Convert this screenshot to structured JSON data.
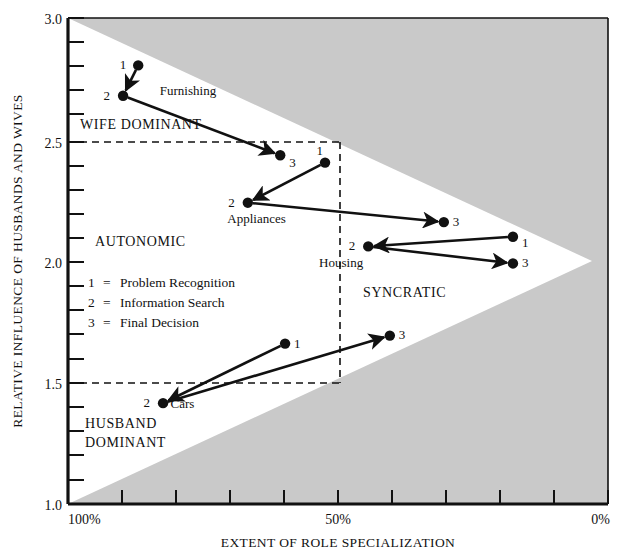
{
  "chart_data": {
    "type": "scatter",
    "title": "",
    "xlabel": "EXTENT OF ROLE SPECIALIZATION",
    "ylabel": "RELATIVE INFLUENCE OF HUSBANDS AND WIVES",
    "xlim": [
      100,
      0
    ],
    "ylim": [
      1.0,
      3.0
    ],
    "x_unit": "%",
    "x_tick_labels": [
      "100%",
      "50%",
      "0%"
    ],
    "x_major_ticks": [
      100,
      50,
      0
    ],
    "x_minor_tick_step": 10,
    "y_tick_labels": [
      "1.0",
      "1.5",
      "2.0",
      "2.5",
      "3.0"
    ],
    "y_major_ticks": [
      1.0,
      1.5,
      2.0,
      2.5,
      3.0
    ],
    "y_minor_tick_step": 0.1,
    "grid": false,
    "legend_position": "inside-left",
    "point_legend": [
      "1  =  Problem Recognition",
      "2  =  Information Search",
      "3  =  Final Decision"
    ],
    "legend_entries": [
      {
        "key": "1",
        "equals": "=",
        "label": "Problem Recognition"
      },
      {
        "key": "2",
        "equals": "=",
        "label": "Information Search"
      },
      {
        "key": "3",
        "equals": "=",
        "label": "Final Decision"
      }
    ],
    "region_labels": [
      {
        "name": "wife-dominant",
        "text": "WIFE DOMINANT",
        "x": 93.0,
        "y": 2.58
      },
      {
        "name": "autonomic",
        "text": "AUTONOMIC",
        "x": 93.5,
        "y": 2.05
      },
      {
        "name": "syncratic",
        "text": "SYNCRATIC",
        "x": 50.5,
        "y": 1.81
      },
      {
        "name": "husband-dominant-line1",
        "text": "HUSBAND",
        "x": 93.5,
        "y": 1.38
      },
      {
        "name": "husband-dominant-line2",
        "text": "DOMINANT",
        "x": 93.5,
        "y": 1.3
      }
    ],
    "reference_box": {
      "x_from": 100,
      "x_to": 50,
      "y_from": 1.5,
      "y_to": 2.5,
      "style": "dashed"
    },
    "shaded_regions": [
      {
        "name": "upper-shaded-wedge",
        "color": "#c9c9c9"
      },
      {
        "name": "lower-shaded-wedge",
        "color": "#c9c9c9"
      }
    ],
    "series": [
      {
        "name": "Furnishing",
        "label": "Furnishing",
        "label_x": 83.0,
        "label_y": 2.685,
        "points": [
          {
            "stage": "1",
            "x": 87.0,
            "y": 2.805,
            "num_dx": -12,
            "num_dy": 4
          },
          {
            "stage": "2",
            "x": 89.8,
            "y": 2.68,
            "num_dx": -13,
            "num_dy": 4
          },
          {
            "stage": "3",
            "x": 60.7,
            "y": 2.435,
            "num_dx": 9,
            "num_dy": 12
          }
        ],
        "arrows": [
          {
            "from": "1",
            "to": "2"
          },
          {
            "from": "2",
            "to": "3"
          }
        ]
      },
      {
        "name": "Appliances",
        "label": "Appliances",
        "label_x": 70.5,
        "label_y": 2.155,
        "points": [
          {
            "stage": "1",
            "x": 52.4,
            "y": 2.405,
            "num_dx": -2,
            "num_dy": -8
          },
          {
            "stage": "2",
            "x": 66.7,
            "y": 2.24,
            "num_dx": -13,
            "num_dy": 4
          },
          {
            "stage": "3",
            "x": 30.4,
            "y": 2.16,
            "num_dx": 9,
            "num_dy": 4
          }
        ],
        "arrows": [
          {
            "from": "1",
            "to": "2"
          },
          {
            "from": "2",
            "to": "3"
          }
        ]
      },
      {
        "name": "Housing",
        "label": "Housing",
        "label_x": 53.5,
        "label_y": 1.975,
        "points": [
          {
            "stage": "1",
            "x": 17.6,
            "y": 2.1,
            "num_dx": 9,
            "num_dy": 10
          },
          {
            "stage": "2",
            "x": 44.4,
            "y": 2.06,
            "num_dx": -13,
            "num_dy": 4
          },
          {
            "stage": "3",
            "x": 17.6,
            "y": 1.99,
            "num_dx": 9,
            "num_dy": 4
          }
        ],
        "arrows": [
          {
            "from": "1",
            "to": "2"
          },
          {
            "from": "2",
            "to": "3"
          }
        ]
      },
      {
        "name": "Cars",
        "label": "Cars",
        "label_x": 81.0,
        "label_y": 1.395,
        "points": [
          {
            "stage": "1",
            "x": 59.8,
            "y": 1.66,
            "num_dx": 9,
            "num_dy": 4
          },
          {
            "stage": "2",
            "x": 82.4,
            "y": 1.415,
            "num_dx": -13,
            "num_dy": 4
          },
          {
            "stage": "3",
            "x": 40.4,
            "y": 1.693,
            "num_dx": 9,
            "num_dy": 3
          }
        ],
        "arrows": [
          {
            "from": "1",
            "to": "2"
          },
          {
            "from": "2",
            "to": "3"
          }
        ]
      }
    ],
    "colors": {
      "shade": "#c9c9c9",
      "plot_background": "#ffffff",
      "ink": "#111111",
      "page": "#ffffff"
    }
  }
}
